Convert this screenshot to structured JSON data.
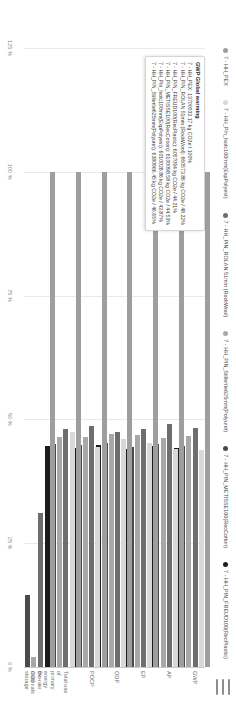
{
  "menu": {
    "icon": "hamburger-icon",
    "label": "Menu"
  },
  "legend": {
    "items": [
      {
        "label": "7 - HH_PEX",
        "color": "#9e9e9e"
      },
      {
        "label": "7 - HH_Pln_Isolc100mm(ExpPolyest)",
        "color": "#d8d8d8"
      },
      {
        "label": "7 - HH_PIN_ROLAN 51mm (RockWool)",
        "color": "#6e6e6e"
      },
      {
        "label": "7 - HH_PIN_Stillerite625mm(Polyuret)",
        "color": "#a8a8a8"
      },
      {
        "label": "7 - HH_PIN_METISSE100(RecCotton)",
        "color": "#4a4a4a"
      },
      {
        "label": "7 - HH_PIN_FREUD100(RecPlastic)",
        "color": "#1c1c1c"
      }
    ]
  },
  "tooltip": {
    "title": "GWP Global warming",
    "rows": [
      "7 - HH_PEX: 13700033.17 kg CO2e / 100%",
      "7 - HH_PIN_ROLAN 51mm (RockWool): 660573.86 kg CO2e / 48.22%",
      "7 - HH_PIN_FREUD100(RecPlastic): 6057094 kg CO2e / 44.21%",
      "7 - HH_PIN_METISSE100(RecCotton): 6100098.58 kg CO2e / 44.53%",
      "7 - HH_Pln_Isolc100mm(ExpPolyest): 6010028.86 kg CO2e / 43.87%",
      "7 - HH_PIN_Stillerite625mm(Polyuret): 6380966.45 kg CO2e / 46.65%"
    ]
  },
  "chart_data": {
    "type": "bar",
    "orientation": "horizontal",
    "title": "",
    "xlabel": "",
    "ylabel": "",
    "ylim": [
      0,
      125
    ],
    "ytick_labels": [
      "125 %",
      "100 %",
      "75 %",
      "50 %",
      "25 %",
      "0 %"
    ],
    "ytick_values": [
      125,
      100,
      75,
      50,
      25,
      0
    ],
    "grid": true,
    "legend_position": "top",
    "categories": [
      "GWP",
      "AP",
      "EP",
      "ODP",
      "POCP",
      "Total use of primary energy\nex. raw materials",
      "Bio-CO2 storage"
    ],
    "series": [
      {
        "name": "7 - HH_PEX",
        "color": "#9e9e9e",
        "values": [
          100,
          100,
          100,
          100,
          100,
          100,
          100
        ]
      },
      {
        "name": "7 - HH_Pln_Isolc100mm(ExpPolyest)",
        "color": "#d8d8d8",
        "values": [
          43.87,
          44.1,
          45.2,
          46.0,
          44.5,
          47.5,
          0.0
        ]
      },
      {
        "name": "7 - HH_PIN_ROLAN 51mm (RockWool)",
        "color": "#6e6e6e",
        "values": [
          48.22,
          49.0,
          48.0,
          47.5,
          48.6,
          48.0,
          31.0
        ]
      },
      {
        "name": "7 - HH_PIN_Stillerite625mm(Polyuret)",
        "color": "#a8a8a8",
        "values": [
          46.65,
          46.2,
          46.8,
          47.0,
          46.4,
          46.5,
          2.0
        ]
      },
      {
        "name": "7 - HH_PIN_METISSE100(RecCotton)",
        "color": "#4a4a4a",
        "values": [
          44.53,
          45.0,
          44.4,
          45.2,
          44.8,
          45.0,
          14.5
        ]
      },
      {
        "name": "7 - HH_PIN_FREUD100(RecPlastic)",
        "color": "#1c1c1c",
        "values": [
          44.21,
          44.6,
          44.0,
          44.8,
          44.2,
          44.6,
          0.0
        ]
      }
    ]
  }
}
